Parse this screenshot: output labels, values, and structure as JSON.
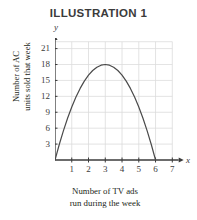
{
  "chart_data": {
    "type": "line",
    "title": "ILLUSTRATION 1",
    "xlabel_lines": [
      "Number of TV ads",
      "run during the week"
    ],
    "ylabel_lines": [
      "Number of AC",
      "units sold that week"
    ],
    "x_axis_letter": "x",
    "y_axis_letter": "y",
    "xlim": [
      0,
      7.4
    ],
    "ylim": [
      0,
      23
    ],
    "xticks": [
      1,
      2,
      3,
      4,
      5,
      6,
      7
    ],
    "xtick_labels": [
      "1",
      "2",
      "3",
      "4",
      "5",
      "6",
      "7"
    ],
    "yticks": [
      3,
      6,
      9,
      12,
      15,
      18,
      21
    ],
    "ytick_labels": [
      "3",
      "6",
      "9",
      "12",
      "15",
      "18",
      "21"
    ],
    "grid": true,
    "grid_color": "#dcdcdc",
    "axis_color": "#3b3b3b",
    "curve_color": "#4a4a4a",
    "legend": null,
    "equation": "y = -2x^2 + 12x",
    "vertex": {
      "x": 3,
      "y": 18
    },
    "x_intercepts": [
      0,
      6
    ],
    "points": [
      {
        "x": 0,
        "y": 0
      },
      {
        "x": 0.25,
        "y": 2.875
      },
      {
        "x": 0.5,
        "y": 5.5
      },
      {
        "x": 0.75,
        "y": 7.875
      },
      {
        "x": 1,
        "y": 10
      },
      {
        "x": 1.25,
        "y": 11.875
      },
      {
        "x": 1.5,
        "y": 13.5
      },
      {
        "x": 1.75,
        "y": 14.875
      },
      {
        "x": 2,
        "y": 16
      },
      {
        "x": 2.25,
        "y": 16.875
      },
      {
        "x": 2.5,
        "y": 17.5
      },
      {
        "x": 2.75,
        "y": 17.875
      },
      {
        "x": 3,
        "y": 18
      },
      {
        "x": 3.25,
        "y": 17.875
      },
      {
        "x": 3.5,
        "y": 17.5
      },
      {
        "x": 3.75,
        "y": 16.875
      },
      {
        "x": 4,
        "y": 16
      },
      {
        "x": 4.25,
        "y": 14.875
      },
      {
        "x": 4.5,
        "y": 13.5
      },
      {
        "x": 4.75,
        "y": 11.875
      },
      {
        "x": 5,
        "y": 10
      },
      {
        "x": 5.25,
        "y": 7.875
      },
      {
        "x": 5.5,
        "y": 5.5
      },
      {
        "x": 5.75,
        "y": 2.875
      },
      {
        "x": 6,
        "y": 0
      }
    ]
  }
}
